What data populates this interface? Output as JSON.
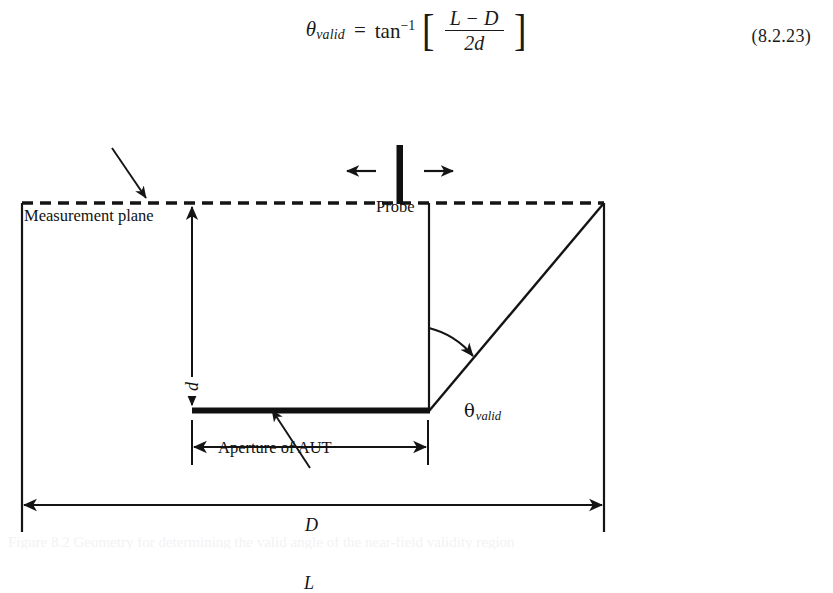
{
  "equation": {
    "lhs_symbol": "θ",
    "lhs_subscript": "valid",
    "equals": "=",
    "function": "tan",
    "exponent": "−1",
    "bracket_open": "[",
    "bracket_close": "]",
    "numerator": "L − D",
    "denominator": "2d",
    "number": "(8.2.23)",
    "full_text": "θ_valid = tan⁻¹ [ (L − D) / (2d) ]"
  },
  "figure": {
    "labels": {
      "measurement_plane": "Measurement plane",
      "probe": "Probe",
      "aperture_of_aut": "Aperture of AUT",
      "theta_symbol": "θ",
      "theta_subscript": "valid"
    },
    "dimensions": {
      "vertical_separation": "d",
      "aperture_width": "D",
      "scan_length": "L"
    },
    "colors": {
      "stroke": "#141414",
      "aperture_bar": "#101010",
      "probe_bar": "#101010",
      "background": "#ffffff"
    },
    "geometry": {
      "measurement_plane_y": 123,
      "left_extension_x": 22,
      "right_extension_x": 604,
      "aperture_left_x": 192,
      "aperture_right_x": 429,
      "aperture_y": 330,
      "probe_x": 400,
      "diagonal_from": "429,330",
      "diagonal_to": "604,123",
      "d_dim_x": 192,
      "D_dim_y": 367,
      "L_dim_y": 425
    }
  },
  "caption": {
    "text": "Figure 8.2 Geometry for determining the valid angle of the near-field validity region"
  }
}
